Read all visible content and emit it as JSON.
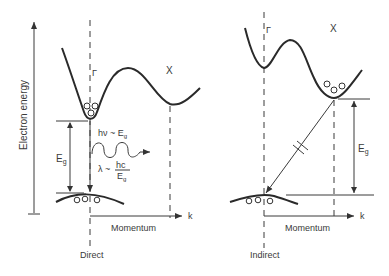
{
  "y_axis": {
    "label": "Electron energy"
  },
  "panels": [
    {
      "name": "direct",
      "caption": "Direct",
      "gamma_label": "Γ",
      "x_label": "X",
      "k_label": "k",
      "momentum_label": "Momentum",
      "gap_label": "E",
      "gap_sub": "g",
      "photon_energy": {
        "prefix": "hν ~ E",
        "sub": "g"
      },
      "wavelength": {
        "prefix": "λ ~",
        "num": "hc",
        "den": "E",
        "den_sub": "g"
      }
    },
    {
      "name": "indirect",
      "caption": "Indirect",
      "gamma_label": "Γ",
      "x_label": "X",
      "k_label": "k",
      "momentum_label": "Momentum",
      "gap_label": "E",
      "gap_sub": "g"
    }
  ],
  "colors": {
    "ink": "#2a2a2a",
    "background": "#ffffff"
  }
}
